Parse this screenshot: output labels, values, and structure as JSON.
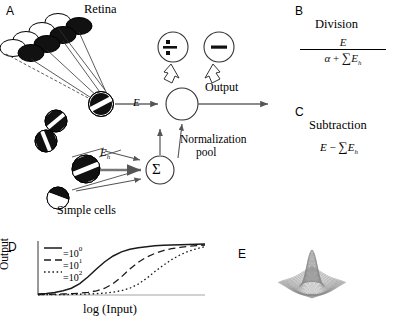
{
  "figure": {
    "panels": [
      {
        "id": "A",
        "label": "A"
      },
      {
        "id": "B",
        "label": "B"
      },
      {
        "id": "C",
        "label": "C"
      },
      {
        "id": "D",
        "label": "D"
      },
      {
        "id": "E",
        "label": "E"
      }
    ]
  },
  "panelA": {
    "title": "Retina",
    "simple_cells_label": "Simple cells",
    "excitation_label": "E",
    "suppressive_label": "E",
    "suppressive_sub": "h",
    "output_label": "Output",
    "normalization_label_line1": "Normalization",
    "normalization_label_line2": "pool",
    "division_glyph": "÷",
    "subtraction_glyph": "−",
    "sum_glyph": "Σ"
  },
  "panelB": {
    "label": "B",
    "title": "Division",
    "numerator": "E",
    "denominator_alpha": "α",
    "denominator_plus": "+",
    "denominator_sum": "∑",
    "denominator_term": "E",
    "denominator_sub": "h"
  },
  "panelC": {
    "label": "C",
    "title": "Subtraction",
    "term1": "E",
    "operator": "−",
    "sum_glyph": "∑",
    "term2": "E",
    "term2_sub": "h"
  },
  "panelD": {
    "label": "D",
    "ylabel": "Output",
    "xlabel": "log (Input)",
    "legend": [
      {
        "style": "solid",
        "equals": "=",
        "base": "10",
        "exp": "0"
      },
      {
        "style": "dashed",
        "equals": "=",
        "base": "10",
        "exp": "1"
      },
      {
        "style": "dotted",
        "equals": "=",
        "base": "10",
        "exp": "2"
      }
    ]
  },
  "panelE": {
    "label": "E",
    "description": "3D mesh surface of a center-surround normalization kernel"
  },
  "chart_data": {
    "type": "line",
    "title": "",
    "xlabel": "log (Input)",
    "ylabel": "Output",
    "xlim": [
      0,
      10
    ],
    "ylim": [
      0,
      1
    ],
    "grid": false,
    "legend_position": "top-left",
    "x": [
      0,
      0.5,
      1,
      1.5,
      2,
      2.5,
      3,
      3.5,
      4,
      4.5,
      5,
      5.5,
      6,
      6.5,
      7,
      7.5,
      8,
      8.5,
      9,
      9.5,
      10
    ],
    "series": [
      {
        "name": "10^0",
        "style": "solid",
        "values": [
          0.02,
          0.03,
          0.05,
          0.08,
          0.13,
          0.22,
          0.35,
          0.5,
          0.64,
          0.75,
          0.83,
          0.88,
          0.91,
          0.93,
          0.945,
          0.955,
          0.962,
          0.968,
          0.972,
          0.976,
          0.98
        ]
      },
      {
        "name": "10^1",
        "style": "dashed",
        "values": [
          0.01,
          0.012,
          0.015,
          0.02,
          0.026,
          0.035,
          0.05,
          0.08,
          0.13,
          0.22,
          0.35,
          0.5,
          0.63,
          0.73,
          0.8,
          0.855,
          0.89,
          0.915,
          0.935,
          0.95,
          0.962
        ]
      },
      {
        "name": "10^2",
        "style": "dotted",
        "values": [
          0.005,
          0.006,
          0.007,
          0.009,
          0.011,
          0.014,
          0.019,
          0.026,
          0.037,
          0.055,
          0.085,
          0.13,
          0.21,
          0.32,
          0.45,
          0.57,
          0.68,
          0.77,
          0.84,
          0.89,
          0.93
        ]
      }
    ]
  }
}
